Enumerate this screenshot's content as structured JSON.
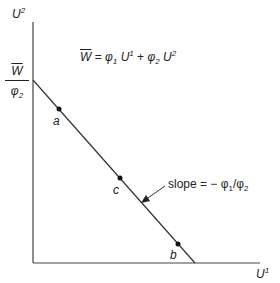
{
  "diagram": {
    "axes": {
      "y_label": "U",
      "y_label_sup": "2",
      "x_label": "U",
      "x_label_sup": "1"
    },
    "intercept_label": {
      "numerator": "W",
      "denominator": "φ",
      "denominator_sub": "2"
    },
    "equation": {
      "lhs": "W",
      "eq": " = ",
      "phi1": "φ",
      "phi1_sub": "1",
      "u1": " U",
      "u1_sup": "1",
      "plus": " + ",
      "phi2": "φ",
      "phi2_sub": "2",
      "u2": " U",
      "u2_sup": "2"
    },
    "slope_annotation": {
      "text": "slope = − φ",
      "sub1": "1",
      "slash": "/φ",
      "sub2": "2"
    },
    "points": [
      {
        "label": "a"
      },
      {
        "label": "c"
      },
      {
        "label": "b"
      }
    ],
    "line_color": "#333333"
  }
}
